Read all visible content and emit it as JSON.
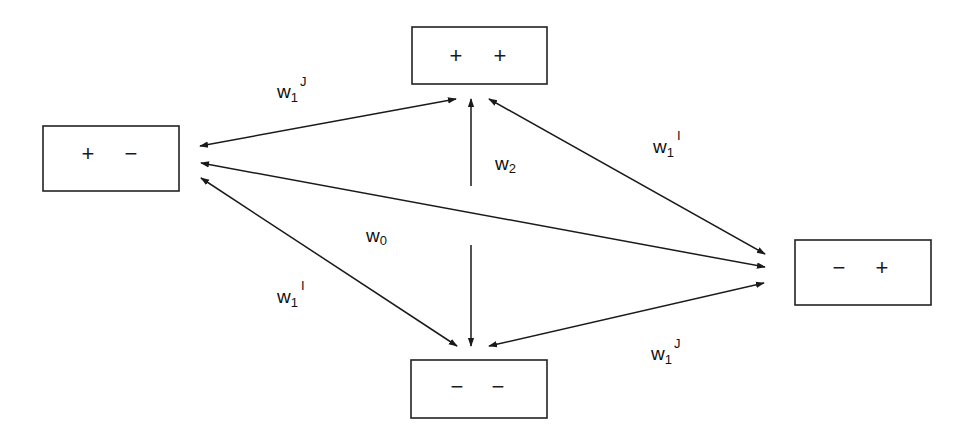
{
  "diagram": {
    "type": "state-transition",
    "colors": {
      "stroke": "#1a1a1a",
      "background": "#ffffff"
    },
    "nodes": [
      {
        "id": "pp",
        "label": "+ +",
        "signs": [
          "+",
          "+"
        ],
        "box": {
          "x": 412,
          "y": 27,
          "w": 135,
          "h": 57
        }
      },
      {
        "id": "pm",
        "label": "+ −",
        "signs": [
          "+",
          "−"
        ],
        "box": {
          "x": 43,
          "y": 126,
          "w": 136,
          "h": 65
        }
      },
      {
        "id": "mp",
        "label": "− +",
        "signs": [
          "−",
          "+"
        ],
        "box": {
          "x": 795,
          "y": 240,
          "w": 136,
          "h": 65
        }
      },
      {
        "id": "mm",
        "label": "− −",
        "signs": [
          "−",
          "−"
        ],
        "box": {
          "x": 411,
          "y": 360,
          "w": 136,
          "h": 58
        }
      }
    ],
    "edges": [
      {
        "from": "pm",
        "to": "pp",
        "label": "w1J",
        "weight": {
          "base": "w",
          "sub": "1",
          "sup": "J"
        }
      },
      {
        "from": "pp",
        "to": "mp",
        "label": "w1I",
        "weight": {
          "base": "w",
          "sub": "1",
          "sup": "I"
        }
      },
      {
        "from": "pm",
        "to": "mp",
        "label": "w0",
        "weight": {
          "base": "w",
          "sub": "0",
          "sup": ""
        }
      },
      {
        "from": "pm",
        "to": "mm",
        "label": "w1I",
        "weight": {
          "base": "w",
          "sub": "1",
          "sup": "I"
        }
      },
      {
        "from": "mm",
        "to": "mp",
        "label": "w1J",
        "weight": {
          "base": "w",
          "sub": "1",
          "sup": "J"
        }
      },
      {
        "from": "mm",
        "to": "pp",
        "label": "w2",
        "weight": {
          "base": "w",
          "sub": "2",
          "sup": ""
        }
      }
    ],
    "labels": {
      "w1J_top": {
        "base": "w",
        "sub": "1",
        "sup": "J"
      },
      "w1I_right": {
        "base": "w",
        "sub": "1",
        "sup": "I"
      },
      "w2": {
        "base": "w",
        "sub": "2"
      },
      "w0": {
        "base": "w",
        "sub": "0"
      },
      "w1I_left": {
        "base": "w",
        "sub": "1",
        "sup": "I"
      },
      "w1J_bottom": {
        "base": "w",
        "sub": "1",
        "sup": "J"
      }
    }
  }
}
